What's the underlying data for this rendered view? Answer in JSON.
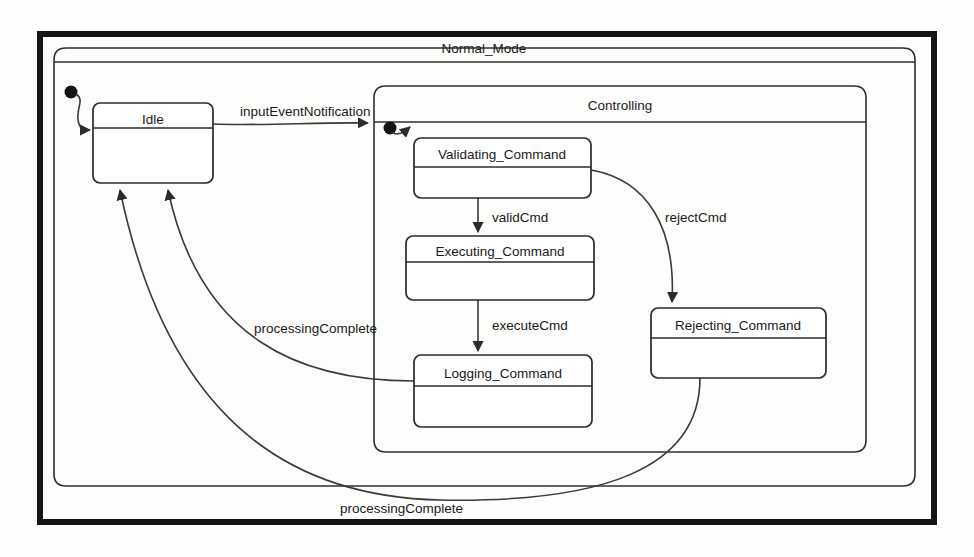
{
  "diagram": {
    "type": "uml-state-machine",
    "outer_region": {
      "name": "Normal_Mode"
    },
    "composite_region": {
      "name": "Controlling"
    },
    "states": [
      {
        "id": "idle",
        "label": "Idle"
      },
      {
        "id": "validating",
        "label": "Validating_Command"
      },
      {
        "id": "executing",
        "label": "Executing_Command"
      },
      {
        "id": "logging",
        "label": "Logging_Command"
      },
      {
        "id": "rejecting",
        "label": "Rejecting_Command"
      }
    ],
    "initial_states": [
      {
        "id": "initial-normal-mode",
        "target": "Idle"
      },
      {
        "id": "initial-controlling",
        "target": "Validating_Command"
      }
    ],
    "transitions": [
      {
        "id": "t1",
        "label": "inputEventNotification",
        "from": "Idle",
        "to": "Controlling"
      },
      {
        "id": "t2",
        "label": "validCmd",
        "from": "Validating_Command",
        "to": "Executing_Command"
      },
      {
        "id": "t3",
        "label": "rejectCmd",
        "from": "Validating_Command",
        "to": "Rejecting_Command"
      },
      {
        "id": "t4",
        "label": "executeCmd",
        "from": "Executing_Command",
        "to": "Logging_Command"
      },
      {
        "id": "t5",
        "label": "processingComplete",
        "from": "Logging_Command",
        "to": "Idle"
      },
      {
        "id": "t6",
        "label": "processingComplete",
        "from": "Rejecting_Command",
        "to": "Idle"
      }
    ],
    "colors": {
      "frame": "#151515",
      "line": "#2e2e2e",
      "text": "#1a1a1a",
      "background": "#fdfdfc"
    }
  }
}
